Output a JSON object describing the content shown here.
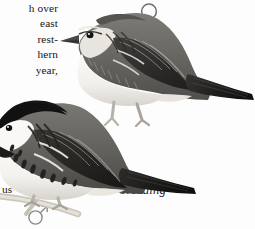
{
  "page": {
    "kind": "field-guide-illustration-plate",
    "background_color": "#fdfdfd",
    "ink_color": "#161616"
  },
  "body_text": {
    "lines": [
      "h over",
      "east",
      "rest-",
      "hern",
      "year,"
    ],
    "tail_fragment": "us"
  },
  "symbols": {
    "female": {
      "name": "female-symbol",
      "glyph": "♀",
      "color": "#6e6e6e"
    },
    "male": {
      "name": "male-symbol",
      "glyph": "♂",
      "color": "#8a8a8a"
    }
  },
  "captions": {
    "breeding": "breeding"
  },
  "illustrations": [
    {
      "id": "bird-nonbreeding",
      "label": "",
      "plumage": "nonbreeding female",
      "posture": "perched, facing left",
      "colors": {
        "upper": "#6d6b66",
        "upper_dark": "#3b3a37",
        "wing": "#2e2d2b",
        "underside": "#f4f2ee",
        "shadow": "#cfccc6",
        "eye": "#141414",
        "bill": "#4a4845",
        "leg": "#b7b2a9"
      }
    },
    {
      "id": "bird-breeding",
      "label": "breeding",
      "plumage": "breeding male",
      "posture": "perched on twig, facing left",
      "colors": {
        "cap": "#151515",
        "cheek": "#f7f6f3",
        "upper": "#6a6864",
        "upper_dark": "#343330",
        "wing": "#252422",
        "underside": "#f6f4f1",
        "streaks": "#232220",
        "shadow": "#cdcac4",
        "eye": "#0d0d0d",
        "bill": "#3f3e3c",
        "leg": "#b9b4ab",
        "twig": "#cbc6bc"
      }
    }
  ]
}
